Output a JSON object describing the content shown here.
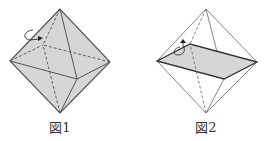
{
  "figures": [
    {
      "id": "fig1",
      "caption": "図1",
      "description": "Regular octahedron, fully shaded, with rotation arrow around an edge"
    },
    {
      "id": "fig2",
      "caption": "図2",
      "description": "Octahedron wireframe with shaded square cross-section through middle vertices, rotation arrow"
    }
  ],
  "colors": {
    "fill": "#d6d6d6",
    "line": "#555555",
    "section_edge": "#333333"
  }
}
